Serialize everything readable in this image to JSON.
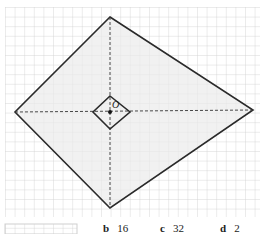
{
  "diagram": {
    "center_label": "O",
    "colors": {
      "grid": "#cfcfcf",
      "fill": "#ebebeb",
      "stroke": "#2a2a2a"
    },
    "outer_kite": {
      "top": [
        110,
        17
      ],
      "right": [
        253,
        110
      ],
      "bottom": [
        110,
        208
      ],
      "left": [
        15,
        112
      ]
    },
    "inner_kite": {
      "top": [
        110,
        96
      ],
      "right": [
        130,
        112
      ],
      "bottom": [
        110,
        129
      ],
      "left": [
        93,
        112
      ]
    }
  },
  "answers": [
    {
      "letter": "b",
      "value": "16"
    },
    {
      "letter": "c",
      "value": "32"
    },
    {
      "letter": "d",
      "value": "2"
    }
  ]
}
